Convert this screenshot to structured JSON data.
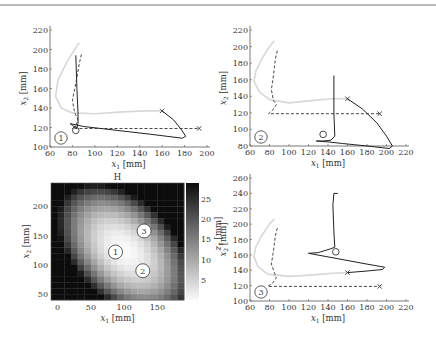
{
  "page": {
    "top_rule_color": "#777777"
  },
  "chart_data": [
    {
      "id": "plot1",
      "type": "line",
      "title": "",
      "xlabel": "x_1 [mm]",
      "ylabel": "x_2 [mm]",
      "xlim": [
        60,
        200
      ],
      "ylim": [
        100,
        220
      ],
      "xticks": [
        60,
        80,
        100,
        120,
        140,
        160,
        180,
        200
      ],
      "yticks": [
        100,
        120,
        140,
        160,
        180,
        200,
        220
      ],
      "grid": false,
      "marker_label": "1",
      "px": {
        "x0": 50,
        "x1": 207,
        "y0": 147,
        "y1": 30
      },
      "series": [
        {
          "name": "reference (light)",
          "style": "light",
          "color": "#d8d8d8",
          "points": [
            [
              86,
              207
            ],
            [
              82,
              200
            ],
            [
              74,
              185
            ],
            [
              67,
              168
            ],
            [
              65,
              152
            ],
            [
              70,
              140
            ],
            [
              80,
              135
            ],
            [
              100,
              134
            ],
            [
              125,
              136
            ],
            [
              145,
              137
            ],
            [
              160,
              137
            ]
          ]
        },
        {
          "name": "target (dashed)",
          "style": "dashed",
          "color": "#333333",
          "points": [
            [
              88,
              195
            ],
            [
              86,
              185
            ],
            [
              83,
              165
            ],
            [
              80,
              148
            ],
            [
              82,
              135
            ],
            [
              85,
              128
            ],
            [
              83,
              122
            ],
            [
              80,
              119
            ],
            [
              100,
              119
            ],
            [
              140,
              119
            ],
            [
              193,
              119
            ]
          ]
        },
        {
          "name": "trajectory (solid)",
          "style": "solid",
          "color": "#222222",
          "points": [
            [
              160,
              137
            ],
            [
              170,
              128
            ],
            [
              177,
              118
            ],
            [
              181,
              111
            ],
            [
              178,
              109
            ],
            [
              150,
              113
            ],
            [
              120,
              117
            ],
            [
              90,
              121
            ],
            [
              78,
              124
            ],
            [
              80,
              122
            ],
            [
              84,
              120
            ],
            [
              85,
              124
            ],
            [
              85,
              135
            ],
            [
              84,
              160
            ],
            [
              83,
              194
            ]
          ]
        }
      ],
      "markers": [
        {
          "type": "x",
          "at": [
            160,
            137
          ]
        },
        {
          "type": "x",
          "at": [
            193,
            119
          ]
        },
        {
          "type": "circle",
          "at": [
            83,
            117
          ]
        }
      ]
    },
    {
      "id": "plot2",
      "type": "line",
      "title": "",
      "xlabel": "x_1 [mm]",
      "ylabel": "x_2 [mm]",
      "xlim": [
        60,
        220
      ],
      "ylim": [
        70,
        220
      ],
      "xticks": [
        60,
        80,
        100,
        120,
        140,
        160,
        180,
        200,
        220
      ],
      "yticks": [
        80,
        100,
        120,
        140,
        160,
        180,
        200,
        220
      ],
      "grid": false,
      "marker_label": "2",
      "px": {
        "x0": 250,
        "x1": 406,
        "y0": 146,
        "y1": 30
      },
      "series": [
        {
          "name": "reference (light)",
          "style": "light",
          "color": "#d8d8d8",
          "points": [
            [
              85,
              207
            ],
            [
              80,
              200
            ],
            [
              72,
              185
            ],
            [
              66,
              170
            ],
            [
              64,
              158
            ],
            [
              70,
              145
            ],
            [
              80,
              136
            ],
            [
              100,
              132
            ],
            [
              125,
              135
            ],
            [
              145,
              137
            ],
            [
              160,
              137
            ]
          ]
        },
        {
          "name": "target (dashed)",
          "style": "dashed",
          "color": "#333333",
          "points": [
            [
              88,
              195
            ],
            [
              86,
              185
            ],
            [
              84,
              165
            ],
            [
              82,
              148
            ],
            [
              84,
              135
            ],
            [
              87,
              130
            ],
            [
              83,
              123
            ],
            [
              79,
              119
            ],
            [
              100,
              119
            ],
            [
              140,
              119
            ],
            [
              193,
              119
            ]
          ]
        },
        {
          "name": "trajectory (solid)",
          "style": "solid",
          "color": "#222222",
          "points": [
            [
              160,
              137
            ],
            [
              175,
              125
            ],
            [
              190,
              108
            ],
            [
              200,
              92
            ],
            [
              206,
              80
            ],
            [
              203,
              77
            ],
            [
              180,
              80
            ],
            [
              155,
              83
            ],
            [
              140,
              85
            ],
            [
              128,
              86
            ],
            [
              135,
              86
            ],
            [
              143,
              87
            ],
            [
              147,
              92
            ],
            [
              146,
              120
            ],
            [
              146,
              165
            ]
          ]
        }
      ],
      "markers": [
        {
          "type": "x",
          "at": [
            160,
            137
          ]
        },
        {
          "type": "x",
          "at": [
            193,
            119
          ]
        },
        {
          "type": "circle",
          "at": [
            135,
            94
          ]
        }
      ]
    },
    {
      "id": "plot3",
      "type": "line",
      "title": "",
      "xlabel": "x_1 [mm]",
      "ylabel": "x_2 [mm]",
      "xlim": [
        60,
        220
      ],
      "ylim": [
        100,
        260
      ],
      "xticks": [
        60,
        80,
        100,
        120,
        140,
        160,
        180,
        200,
        220
      ],
      "yticks": [
        100,
        120,
        140,
        160,
        180,
        200,
        220,
        240,
        260
      ],
      "grid": false,
      "marker_label": "3",
      "px": {
        "x0": 250,
        "x1": 406,
        "y0": 301,
        "y1": 178
      },
      "series": [
        {
          "name": "reference (light)",
          "style": "light",
          "color": "#d8d8d8",
          "points": [
            [
              85,
              207
            ],
            [
              80,
              200
            ],
            [
              72,
              185
            ],
            [
              66,
              170
            ],
            [
              64,
              158
            ],
            [
              68,
              145
            ],
            [
              78,
              135
            ],
            [
              100,
              132
            ],
            [
              125,
              134
            ],
            [
              145,
              136
            ],
            [
              160,
              137
            ]
          ]
        },
        {
          "name": "target (dashed)",
          "style": "dashed",
          "color": "#333333",
          "points": [
            [
              88,
              195
            ],
            [
              86,
              185
            ],
            [
              84,
              165
            ],
            [
              82,
              148
            ],
            [
              85,
              137
            ],
            [
              87,
              130
            ],
            [
              83,
              123
            ],
            [
              78,
              119
            ],
            [
              100,
              119
            ],
            [
              140,
              119
            ],
            [
              193,
              119
            ]
          ]
        },
        {
          "name": "trajectory (solid)",
          "style": "solid",
          "color": "#222222",
          "points": [
            [
              160,
              137
            ],
            [
              180,
              139
            ],
            [
              196,
              141
            ],
            [
              198,
              144
            ],
            [
              180,
              148
            ],
            [
              150,
              155
            ],
            [
              120,
              162
            ],
            [
              130,
              163
            ],
            [
              143,
              168
            ],
            [
              147,
              170
            ],
            [
              146,
              190
            ],
            [
              145,
              225
            ],
            [
              146,
              240
            ],
            [
              150,
              240
            ]
          ]
        }
      ],
      "markers": [
        {
          "type": "x",
          "at": [
            160,
            137
          ]
        },
        {
          "type": "x",
          "at": [
            193,
            119
          ]
        },
        {
          "type": "circle",
          "at": [
            148,
            164
          ]
        }
      ]
    },
    {
      "id": "heatmap",
      "type": "heatmap",
      "title": "H",
      "xlabel": "x_1 [mm]",
      "ylabel": "x_2 [mm]",
      "colorbar_label": "z_1 [mm]",
      "xlim": [
        -10,
        190
      ],
      "ylim": [
        40,
        240
      ],
      "xticks": [
        0,
        50,
        100,
        150
      ],
      "yticks": [
        50,
        100,
        150,
        200
      ],
      "colorbar_ticks": [
        5,
        10,
        15,
        20,
        25
      ],
      "colorbar_range": [
        0,
        29
      ],
      "colormap": "gray_r",
      "grid_size": [
        20,
        20
      ],
      "peak": {
        "x": 100,
        "y": 125,
        "value": 29
      },
      "px": {
        "x0": 51,
        "x1": 184,
        "y0": 300,
        "y1": 183
      },
      "annotations": [
        {
          "label": "1",
          "x": 87,
          "y": 122
        },
        {
          "label": "2",
          "x": 128,
          "y": 90
        },
        {
          "label": "3",
          "x": 130,
          "y": 158
        }
      ]
    }
  ]
}
